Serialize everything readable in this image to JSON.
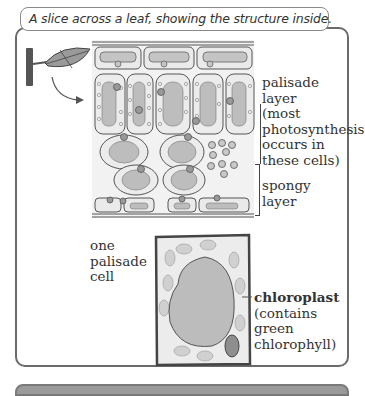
{
  "caption": "A slice across a leaf, showing the structure inside.",
  "labels": {
    "palisade_layer": [
      "palisade",
      "layer",
      "(most",
      "photosynthesis",
      "occurs in",
      "these cells)"
    ],
    "spongy_layer": [
      "spongy",
      "layer"
    ],
    "one_palisade_cell": [
      "one",
      "palisade",
      "cell"
    ],
    "chloroplast_title": "chloroplast",
    "chloroplast_desc": [
      "(contains",
      "green",
      "chlorophyll)"
    ]
  },
  "colors": {
    "frame": "#6b6b6b",
    "cell_fill": "#e6e6e6",
    "vacuole": "#b9b9b9",
    "chloroplast": "#c8c8c8",
    "nucleus": "#8f8f8f",
    "stem": "#555555",
    "leaf": "#9a9a9a"
  }
}
